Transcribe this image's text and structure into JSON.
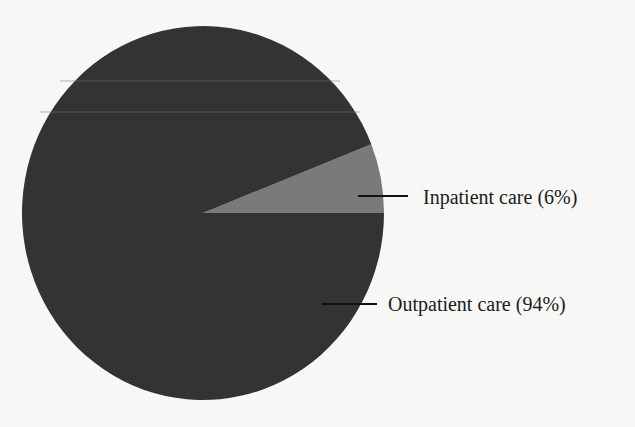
{
  "chart_data": {
    "type": "pie",
    "title": "",
    "categories": [
      "Inpatient care",
      "Outpatient care"
    ],
    "values": [
      6,
      94
    ],
    "unit": "%",
    "labels": [
      "Inpatient care (6%)",
      "Outpatient care (94%)"
    ],
    "colors": [
      "#7a7a7a",
      "#333333"
    ],
    "start_angle_deg": 0,
    "direction": "counterclockwise",
    "legend": "none (direct leader-line labels on right)"
  },
  "labels": {
    "inpatient": "Inpatient care (6%)",
    "outpatient": "Outpatient care (94%)"
  }
}
